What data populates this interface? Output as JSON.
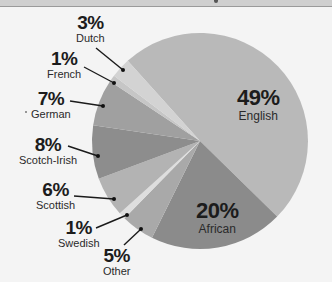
{
  "chart_data": {
    "type": "pie",
    "title": "",
    "start_angle_deg": -42,
    "direction": "clockwise",
    "center": [
      200,
      141
    ],
    "radius": 108,
    "slices": [
      {
        "label": "English",
        "value": 49,
        "display": "49%",
        "color": "#b9b9b9"
      },
      {
        "label": "African",
        "value": 20,
        "display": "20%",
        "color": "#8b8b8b"
      },
      {
        "label": "Other",
        "value": 5,
        "display": "5%",
        "color": "#a9a9a9"
      },
      {
        "label": "Swedish",
        "value": 1,
        "display": "1%",
        "color": "#dedede"
      },
      {
        "label": "Scottish",
        "value": 6,
        "display": "6%",
        "color": "#b3b3b3"
      },
      {
        "label": "Scotch-Irish",
        "value": 8,
        "display": "8%",
        "color": "#8d8d8d"
      },
      {
        "label": "German",
        "value": 7,
        "display": "7%",
        "color": "#a0a0a0"
      },
      {
        "label": "French",
        "value": 1,
        "display": "1%",
        "color": "#c6c6c6"
      },
      {
        "label": "Dutch",
        "value": 3,
        "display": "3%",
        "color": "#d3d3d3"
      }
    ],
    "legend": "none (inline callout labels)"
  },
  "labels": {
    "english": {
      "pct": "49%",
      "name": "English"
    },
    "african": {
      "pct": "20%",
      "name": "African"
    },
    "other": {
      "pct": "5%",
      "name": "Other"
    },
    "swedish": {
      "pct": "1%",
      "name": "Swedish"
    },
    "scottish": {
      "pct": "6%",
      "name": "Scottish"
    },
    "scotch_irish": {
      "pct": "8%",
      "name": "Scotch-Irish"
    },
    "german": {
      "pct": "7%",
      "name": "German"
    },
    "french": {
      "pct": "1%",
      "name": "French"
    },
    "dutch": {
      "pct": "3%",
      "name": "Dutch"
    }
  },
  "leaders": [
    {
      "slice": "Dutch",
      "from": [
        96,
        48
      ],
      "to": [
        123,
        70
      ]
    },
    {
      "slice": "French",
      "from": [
        84,
        67
      ],
      "to": [
        114,
        83
      ]
    },
    {
      "slice": "German",
      "from": [
        70,
        101
      ],
      "to": [
        103,
        106
      ]
    },
    {
      "slice": "Scotch-Irish",
      "from": [
        68,
        146
      ],
      "to": [
        98,
        156
      ]
    },
    {
      "slice": "Scottish",
      "from": [
        74,
        196
      ],
      "to": [
        114,
        199
      ]
    },
    {
      "slice": "Swedish",
      "from": [
        96,
        228
      ],
      "to": [
        127,
        215
      ]
    },
    {
      "slice": "Other",
      "from": [
        124,
        245
      ],
      "to": [
        141,
        229
      ]
    }
  ]
}
